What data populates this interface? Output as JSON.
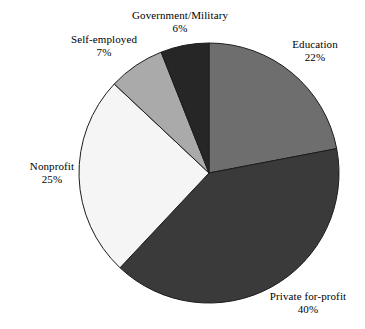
{
  "chart_data": {
    "type": "pie",
    "title": "",
    "subtitle": "",
    "xlabel": "",
    "ylabel": "",
    "legend": "none",
    "grid": false,
    "label_format": "name above percent",
    "start_angle_deg": 0,
    "direction": "clockwise",
    "categories": [
      "Education",
      "Private for-profit",
      "Nonprofit",
      "Self-employed",
      "Government/Military"
    ],
    "values": [
      22,
      40,
      25,
      7,
      6
    ],
    "unit": "%",
    "slices": [
      {
        "name": "Education",
        "value": 22,
        "value_label": "22%",
        "color": "#6e6e6e",
        "start_deg": 0,
        "end_deg": 79.2
      },
      {
        "name": "Private for-profit",
        "value": 40,
        "value_label": "40%",
        "color": "#3a3a3a",
        "start_deg": 79.2,
        "end_deg": 223.2
      },
      {
        "name": "Nonprofit",
        "value": 25,
        "value_label": "25%",
        "color": "#f5f5f5",
        "start_deg": 223.2,
        "end_deg": 313.2
      },
      {
        "name": "Self-employed",
        "value": 7,
        "value_label": "7%",
        "color": "#aaaaaa",
        "start_deg": 313.2,
        "end_deg": 338.4
      },
      {
        "name": "Government/Military",
        "value": 6,
        "value_label": "6%",
        "color": "#262626",
        "start_deg": 338.4,
        "end_deg": 360
      }
    ]
  },
  "geometry": {
    "center_x": 209,
    "center_y": 173,
    "radius": 130
  },
  "style": {
    "background": "#ffffff",
    "outline": "#1c1c1c",
    "text": "#000000"
  }
}
